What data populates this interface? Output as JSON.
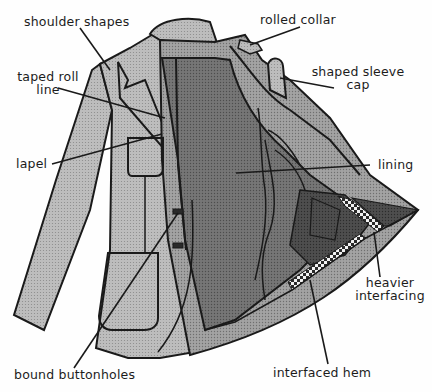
{
  "diagram": {
    "colors": {
      "background": "#fefefe",
      "jacket_shell": "#b5b5b5",
      "lining": "#6e6e6e",
      "facing_dark": "#4a4a4a",
      "hem_interfacing": "#9a9a9a",
      "outline": "#1a1a1a",
      "label_text": "#1c1c1c"
    },
    "labels": [
      {
        "id": "shoulder-shapes",
        "text": "shoulder shapes"
      },
      {
        "id": "rolled-collar",
        "text": "rolled collar"
      },
      {
        "id": "taped-roll-line",
        "line1": "taped roll",
        "line2": "line"
      },
      {
        "id": "shaped-sleeve-cap",
        "line1": "shaped sleeve",
        "line2": "cap"
      },
      {
        "id": "lapel",
        "text": "lapel"
      },
      {
        "id": "lining",
        "text": "lining"
      },
      {
        "id": "heavier-interfacing",
        "line1": "heavier",
        "line2": "interfacing"
      },
      {
        "id": "bound-buttonholes",
        "text": "bound buttonholes"
      },
      {
        "id": "interfaced-hem",
        "text": "interfaced hem"
      }
    ]
  }
}
